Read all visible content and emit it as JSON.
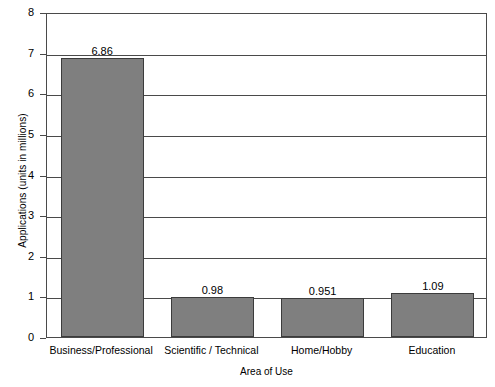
{
  "chart_data": {
    "type": "bar",
    "title": "",
    "xlabel": "Area of Use",
    "ylabel": "Applications (units in millions)",
    "categories": [
      "Business/Professional",
      "Scientific / Technical",
      "Home/Hobby",
      "Education"
    ],
    "values": [
      6.86,
      0.98,
      0.951,
      1.09
    ],
    "value_labels": [
      "6.86",
      "0.98",
      "0.951",
      "1.09"
    ],
    "ylim": [
      0,
      8
    ],
    "yticks": [
      0,
      1,
      2,
      3,
      4,
      5,
      6,
      7,
      8
    ],
    "ytick_labels": [
      "0",
      "1",
      "2",
      "3",
      "4",
      "5",
      "6",
      "7",
      "8"
    ],
    "grid": true,
    "legend": "none",
    "bar_color": "#7f7f7f",
    "bar_edge_color": "#3c3c3c",
    "axis_color": "#4a4a4a",
    "background": "#ffffff"
  }
}
